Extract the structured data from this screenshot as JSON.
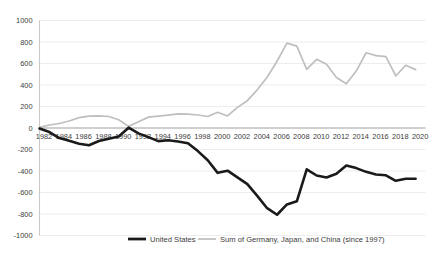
{
  "chart_data": {
    "type": "line",
    "title": "",
    "subtitle": "",
    "xlabel": "",
    "ylabel": "",
    "ylim": [
      -1000,
      1000
    ],
    "ytick_step": 200,
    "yticks": [
      "1000",
      "800",
      "600",
      "400",
      "200",
      "0",
      "-200",
      "-400",
      "-600",
      "-800",
      "-1000"
    ],
    "xticks": [
      "1982",
      "1984",
      "1986",
      "1988",
      "1990",
      "1992",
      "1994",
      "1996",
      "1998",
      "2000",
      "2002",
      "2004",
      "2006",
      "2008",
      "2010",
      "2012",
      "2014",
      "2016",
      "2018",
      "2020"
    ],
    "xlim": [
      1982,
      2021
    ],
    "grid": true,
    "grid_axis": "y",
    "legend_position": "bottom",
    "x": [
      1982,
      1983,
      1984,
      1985,
      1986,
      1987,
      1988,
      1989,
      1990,
      1991,
      1992,
      1993,
      1994,
      1995,
      1996,
      1997,
      1998,
      1999,
      2000,
      2001,
      2002,
      2003,
      2004,
      2005,
      2006,
      2007,
      2008,
      2009,
      2010,
      2011,
      2012,
      2013,
      2014,
      2015,
      2016,
      2017,
      2018,
      2019,
      2020
    ],
    "series": [
      {
        "name": "United States",
        "color": "#1a1a1a",
        "width": 2.6,
        "values": [
          -5,
          -38,
          -94,
          -118,
          -147,
          -160,
          -121,
          -99,
          -79,
          3,
          -50,
          -85,
          -122,
          -114,
          -125,
          -141,
          -215,
          -300,
          -417,
          -397,
          -459,
          -522,
          -631,
          -746,
          -807,
          -711,
          -682,
          -384,
          -442,
          -460,
          -426,
          -349,
          -373,
          -408,
          -433,
          -440,
          -491,
          -472,
          -472
        ]
      },
      {
        "name": "Sum of Germany, Japan, and China (since 1997)",
        "color": "#bfbfbf",
        "width": 1.7,
        "values": [
          6,
          28,
          42,
          65,
          96,
          111,
          113,
          107,
          77,
          15,
          58,
          101,
          110,
          120,
          131,
          129,
          121,
          107,
          146,
          112,
          192,
          254,
          355,
          472,
          621,
          790,
          762,
          545,
          639,
          594,
          470,
          411,
          530,
          700,
          673,
          664,
          484,
          584,
          543
        ]
      }
    ]
  },
  "legend": {
    "items": [
      {
        "label": "United States",
        "color": "#1a1a1a"
      },
      {
        "label": "Sum of Germany, Japan, and China (since 1997)",
        "color": "#bfbfbf"
      }
    ]
  }
}
